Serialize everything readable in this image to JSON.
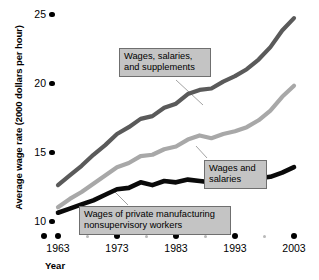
{
  "chart_data": {
    "type": "line",
    "title": "",
    "xlabel": "Year",
    "ylabel": "Average wage rate (2000 dollars per hour)",
    "xlim": [
      1963,
      2003
    ],
    "ylim": [
      10,
      25
    ],
    "ytick_labels": [
      "25",
      "20",
      "15",
      "10"
    ],
    "ytick_values": [
      25,
      20,
      15,
      10
    ],
    "xtick_labels": [
      "1963",
      "1973",
      "1983",
      "1993",
      "2003"
    ],
    "xtick_values": [
      1963,
      1973,
      1983,
      1993,
      2003
    ],
    "grid": false,
    "legend_position": "inline-callouts",
    "series": [
      {
        "name": "Wages, salaries, and supplements",
        "color": "#5a5a5a",
        "x": [
          1963,
          1965,
          1967,
          1969,
          1971,
          1973,
          1975,
          1977,
          1979,
          1981,
          1983,
          1985,
          1987,
          1989,
          1991,
          1993,
          1995,
          1997,
          1999,
          2001,
          2003
        ],
        "values": [
          12.6,
          13.3,
          14.0,
          14.8,
          15.5,
          16.3,
          16.8,
          17.4,
          17.6,
          18.2,
          18.5,
          19.2,
          19.5,
          19.6,
          20.1,
          20.5,
          21.0,
          21.7,
          22.6,
          23.8,
          24.7
        ]
      },
      {
        "name": "Wages and salaries",
        "color": "#a8a8a8",
        "x": [
          1963,
          1965,
          1967,
          1969,
          1971,
          1973,
          1975,
          1977,
          1979,
          1981,
          1983,
          1985,
          1987,
          1989,
          1991,
          1993,
          1995,
          1997,
          1999,
          2001,
          2003
        ],
        "values": [
          11.0,
          11.6,
          12.1,
          12.7,
          13.3,
          13.9,
          14.2,
          14.7,
          14.8,
          15.2,
          15.4,
          15.9,
          16.2,
          16.0,
          16.3,
          16.5,
          16.8,
          17.3,
          18.0,
          19.0,
          19.8
        ]
      },
      {
        "name": "Wages of private manufacturing nonsupervisory workers",
        "color": "#0a0a0a",
        "x": [
          1963,
          1965,
          1967,
          1969,
          1971,
          1973,
          1975,
          1977,
          1979,
          1981,
          1983,
          1985,
          1987,
          1989,
          1991,
          1993,
          1995,
          1997,
          1999,
          2001,
          2003
        ],
        "values": [
          10.6,
          10.9,
          11.2,
          11.5,
          11.9,
          12.3,
          12.4,
          12.8,
          12.6,
          12.9,
          12.8,
          13.0,
          12.9,
          12.8,
          12.9,
          13.0,
          13.0,
          13.1,
          13.2,
          13.5,
          13.9
        ]
      }
    ],
    "annotations": [
      {
        "id": "callout-supplements",
        "text_line1": "Wages, salaries,",
        "text_line2": "and supplements"
      },
      {
        "id": "callout-wages-salaries",
        "text_line1": "Wages and",
        "text_line2": "salaries"
      },
      {
        "id": "callout-nonsupervisory",
        "text_line1": "Wages of private manufacturing",
        "text_line2": "nonsupervisory workers"
      }
    ]
  }
}
